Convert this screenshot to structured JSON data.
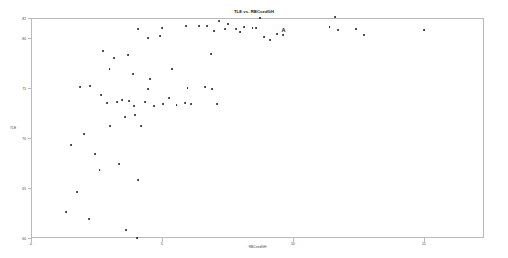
{
  "chart_data": {
    "type": "scatter",
    "title": "TLE vs. RBCsedGH",
    "xlabel": "RBCsedGH",
    "ylabel": "TLE",
    "xlim": [
      0,
      17.3
    ],
    "ylim": [
      60,
      82
    ],
    "grid": false,
    "legend": null,
    "xticks": [
      0,
      5,
      10,
      15
    ],
    "xtick_labels": [
      "0",
      "5",
      "10",
      "15"
    ],
    "yticks": [
      60,
      65,
      70,
      75,
      80,
      82
    ],
    "ytick_labels": [
      "60",
      "65",
      "70",
      "75",
      "80",
      "82"
    ],
    "marker": "dot",
    "marker_color": "#1a1a1a",
    "frame_color": "#b9b9b9",
    "annotations": [
      {
        "label": "A",
        "x": 9.64,
        "y": 80.3
      }
    ],
    "points": [
      {
        "x": 1.33,
        "y": 62.6
      },
      {
        "x": 2.23,
        "y": 61.9
      },
      {
        "x": 3.62,
        "y": 60.8
      },
      {
        "x": 1.75,
        "y": 64.6
      },
      {
        "x": 2.62,
        "y": 66.8
      },
      {
        "x": 1.52,
        "y": 69.3
      },
      {
        "x": 3.35,
        "y": 67.4
      },
      {
        "x": 4.1,
        "y": 65.8
      },
      {
        "x": 2.45,
        "y": 68.4
      },
      {
        "x": 3.02,
        "y": 71.2
      },
      {
        "x": 3.95,
        "y": 73.2
      },
      {
        "x": 3.58,
        "y": 72.1
      },
      {
        "x": 1.88,
        "y": 75.1
      },
      {
        "x": 2.26,
        "y": 75.2
      },
      {
        "x": 2.68,
        "y": 74.3
      },
      {
        "x": 2.9,
        "y": 73.5
      },
      {
        "x": 3.3,
        "y": 73.6
      },
      {
        "x": 3.48,
        "y": 73.8
      },
      {
        "x": 3.74,
        "y": 73.7
      },
      {
        "x": 3.98,
        "y": 72.3
      },
      {
        "x": 4.2,
        "y": 71.2
      },
      {
        "x": 4.34,
        "y": 73.6
      },
      {
        "x": 4.46,
        "y": 74.9
      },
      {
        "x": 3.9,
        "y": 76.4
      },
      {
        "x": 3.72,
        "y": 78.3
      },
      {
        "x": 3.18,
        "y": 78.0
      },
      {
        "x": 2.76,
        "y": 78.7
      },
      {
        "x": 4.48,
        "y": 80.0
      },
      {
        "x": 4.08,
        "y": 80.9
      },
      {
        "x": 4.92,
        "y": 80.2
      },
      {
        "x": 4.56,
        "y": 75.9
      },
      {
        "x": 4.7,
        "y": 73.2
      },
      {
        "x": 5.05,
        "y": 73.4
      },
      {
        "x": 5.28,
        "y": 74.0
      },
      {
        "x": 5.4,
        "y": 76.9
      },
      {
        "x": 5.02,
        "y": 81.0
      },
      {
        "x": 5.56,
        "y": 73.3
      },
      {
        "x": 5.88,
        "y": 73.5
      },
      {
        "x": 6.12,
        "y": 73.4
      },
      {
        "x": 5.98,
        "y": 75.0
      },
      {
        "x": 6.42,
        "y": 81.2
      },
      {
        "x": 6.74,
        "y": 81.2
      },
      {
        "x": 6.86,
        "y": 78.4
      },
      {
        "x": 6.66,
        "y": 75.1
      },
      {
        "x": 6.9,
        "y": 74.9
      },
      {
        "x": 7.12,
        "y": 73.4
      },
      {
        "x": 7.0,
        "y": 80.7
      },
      {
        "x": 7.4,
        "y": 80.9
      },
      {
        "x": 7.52,
        "y": 81.4
      },
      {
        "x": 7.18,
        "y": 81.7
      },
      {
        "x": 7.82,
        "y": 80.9
      },
      {
        "x": 8.12,
        "y": 81.1
      },
      {
        "x": 8.0,
        "y": 80.6
      },
      {
        "x": 8.46,
        "y": 81.0
      },
      {
        "x": 8.58,
        "y": 81.0
      },
      {
        "x": 8.74,
        "y": 82.0
      },
      {
        "x": 8.9,
        "y": 80.1
      },
      {
        "x": 9.12,
        "y": 79.8
      },
      {
        "x": 9.38,
        "y": 80.4
      },
      {
        "x": 9.64,
        "y": 80.3
      },
      {
        "x": 5.92,
        "y": 81.2
      },
      {
        "x": 11.4,
        "y": 81.1
      },
      {
        "x": 11.62,
        "y": 82.1
      },
      {
        "x": 11.72,
        "y": 80.8
      },
      {
        "x": 12.4,
        "y": 80.9
      },
      {
        "x": 12.72,
        "y": 80.3
      },
      {
        "x": 15.02,
        "y": 80.8
      },
      {
        "x": 4.04,
        "y": 60.0
      },
      {
        "x": 2.02,
        "y": 70.4
      },
      {
        "x": 3.0,
        "y": 76.9
      }
    ]
  }
}
